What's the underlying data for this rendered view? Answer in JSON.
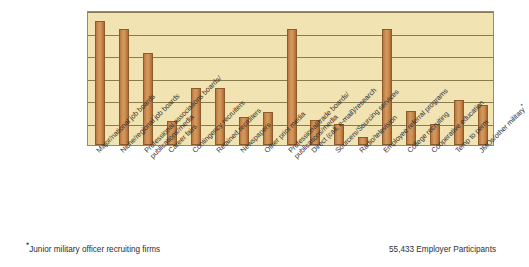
{
  "chart_data": {
    "type": "bar",
    "title": "",
    "subtitle": "",
    "xlabel": "",
    "ylabel": "",
    "ylim": [
      0,
      6
    ],
    "grid": true,
    "gridline_count": 6,
    "legend": "none",
    "categories": [
      "Major/national job boards",
      "Niche/regional job boards",
      "Professional associations boards/ publications/media",
      "Career fairs",
      "Contingency recruiters",
      "Retained recruiters",
      "Newspapers",
      "Other print media",
      "Professional/trade boards/ publications/media",
      "Direct (call, e-mail)/research",
      "Sourcers/Sourcing services",
      "Radio/television",
      "Employee referral programs",
      "College recruiting",
      "Cooperative education",
      "Temp to perm",
      "JMOs/other military*"
    ],
    "category_lines": [
      [
        "Major/national job boards",
        ""
      ],
      [
        "Niche/regional job boards",
        ""
      ],
      [
        "Professional associations boards/",
        "publications/media"
      ],
      [
        "Career fairs",
        ""
      ],
      [
        "Contingency recruiters",
        ""
      ],
      [
        "Retained recruiters",
        ""
      ],
      [
        "Newspapers",
        ""
      ],
      [
        "Other print media",
        ""
      ],
      [
        "Professional/trade boards/",
        "publications/media"
      ],
      [
        "Direct (call, e-mail)/research",
        ""
      ],
      [
        "Sourcers/Sourcing services",
        ""
      ],
      [
        "Radio/television",
        ""
      ],
      [
        "Employee referral programs",
        ""
      ],
      [
        "College recruiting",
        ""
      ],
      [
        "Cooperative education",
        ""
      ],
      [
        "Temp to perm",
        ""
      ],
      [
        "JMOs/other military",
        "*"
      ]
    ],
    "values": [
      5.5,
      5.15,
      4.1,
      1.05,
      2.55,
      2.55,
      1.25,
      1.45,
      5.15,
      1.1,
      0.95,
      0.35,
      5.15,
      1.5,
      0.95,
      2.0,
      1.8
    ],
    "bar_color": "#c98a4e",
    "bar_edge_color": "#8d5a2b",
    "plot_background": "#f2e3b3",
    "gridline_color": "#8b7a4e",
    "axis_border_color": "#9a8a5c"
  },
  "annotations": {
    "footnote_marker": "*",
    "footnote_text": "Junior military officer recruiting firms",
    "participants": "55,433 Employer Participants"
  }
}
